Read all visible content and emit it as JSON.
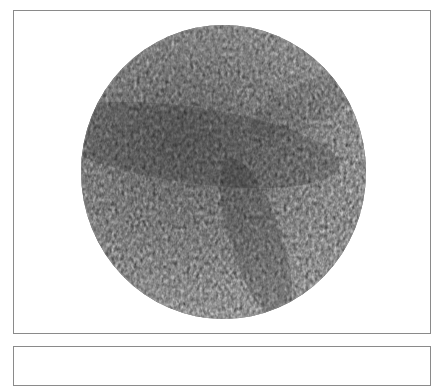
{
  "figure": {
    "panels": [
      {
        "id": "top",
        "content": "circular-micrograph",
        "border_color": "#8a8a8a"
      },
      {
        "id": "bottom",
        "content": "empty",
        "border_color": "#8a8a8a"
      }
    ],
    "micrograph": {
      "shape": "circle",
      "texture": "labyrinthine-stripe-pattern",
      "palette": {
        "base": "#7a7a7a",
        "dark": "#3a3a3a",
        "light": "#d8d8d8"
      },
      "dark_bands": [
        {
          "orientation": "horizontal",
          "position": "upper-middle-left"
        },
        {
          "orientation": "diagonal",
          "position": "center-to-lower-right"
        }
      ]
    }
  }
}
